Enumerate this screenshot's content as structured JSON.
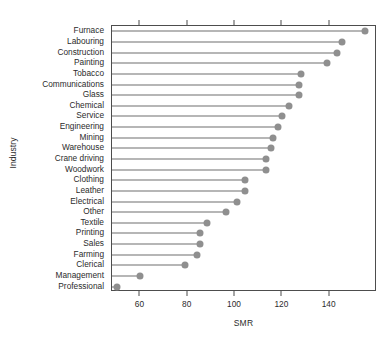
{
  "chart_data": {
    "type": "scatter",
    "title": "",
    "subtitle": "",
    "xlabel": "SMR",
    "ylabel": "Industry",
    "xlim": [
      48,
      160
    ],
    "ylim": [
      0,
      25
    ],
    "grid": false,
    "legend": null,
    "orientation": "horizontal",
    "style": "dotchart-with-rules",
    "xticks": [
      60,
      80,
      100,
      120,
      140
    ],
    "xtick_labels": [
      "60",
      "80",
      "100",
      "120",
      "140"
    ],
    "top_axis_ticks": [
      60,
      80,
      100,
      120,
      140
    ],
    "marker": {
      "shape": "circle",
      "color": "#8f8f8f",
      "size": 7
    },
    "rule_color": "#6e6e6e",
    "axis_color": "#4d4d4d",
    "categories": [
      "Furnace",
      "Labouring",
      "Construction",
      "Painting",
      "Tobacco",
      "Communications",
      "Glass",
      "Chemical",
      "Service",
      "Engineering",
      "Mining",
      "Warehouse",
      "Crane driving",
      "Woodwork",
      "Clothing",
      "Leather",
      "Electrical",
      "Other",
      "Textile",
      "Printing",
      "Sales",
      "Farming",
      "Clerical",
      "Management",
      "Professional"
    ],
    "values": [
      155,
      145,
      143,
      139,
      128,
      127,
      127,
      123,
      120,
      118,
      116,
      115,
      113,
      113,
      104,
      104,
      101,
      96,
      88,
      85,
      85,
      84,
      79,
      60,
      50
    ]
  },
  "caption_sliver": "",
  "axis": {
    "x_title": "SMR",
    "y_title": "Industry"
  }
}
